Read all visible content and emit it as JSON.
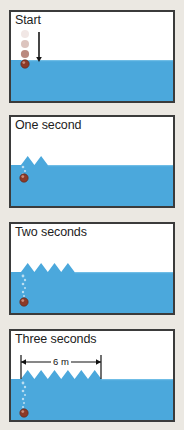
{
  "figure": {
    "title_alt": "Wave pulses generated by a falling ball",
    "background_color": "#ebe8e2",
    "water_color": "#4ba8dc",
    "water_color_light": "#6fbde6",
    "panel_border_color": "#3b3b3b",
    "panel_fill_color": "#ffffff",
    "ball_color": "#8c3a28",
    "bubble_color": "#cfe7f5"
  },
  "panels": [
    {
      "id": "start",
      "label": "Start",
      "time_seconds": 0,
      "wave_peaks": 0,
      "wavefront_x_m": 0,
      "water_level_y": 48,
      "ball": {
        "x": 14,
        "y": 52,
        "r": 4.2
      },
      "ball_trail": [
        {
          "x": 14,
          "y": 22,
          "r": 4.0,
          "opacity": 0.12
        },
        {
          "x": 14,
          "y": 32,
          "r": 4.0,
          "opacity": 0.3
        },
        {
          "x": 14,
          "y": 42,
          "r": 4.1,
          "opacity": 0.6
        }
      ],
      "arrow": {
        "x": 28,
        "y1": 20,
        "y2": 50
      },
      "bubbles": [],
      "dimension": null
    },
    {
      "id": "one-second",
      "label": "One second",
      "time_seconds": 1,
      "wave_peaks": 2,
      "wavefront_x_m": 2,
      "water_level_y": 48,
      "ball": {
        "x": 13,
        "y": 61,
        "r": 4.2
      },
      "ball_trail": [],
      "arrow": null,
      "bubbles": [
        {
          "x": 12,
          "y": 50,
          "r": 1.3
        },
        {
          "x": 14,
          "y": 54,
          "r": 1.1
        },
        {
          "x": 12,
          "y": 57,
          "r": 1.0
        }
      ],
      "dimension": null
    },
    {
      "id": "two-seconds",
      "label": "Two seconds",
      "time_seconds": 2,
      "wave_peaks": 4,
      "wavefront_x_m": 4,
      "water_level_y": 48,
      "ball": {
        "x": 13,
        "y": 78,
        "r": 4.2
      },
      "ball_trail": [],
      "arrow": null,
      "bubbles": [
        {
          "x": 12,
          "y": 52,
          "r": 1.4
        },
        {
          "x": 14,
          "y": 56,
          "r": 1.2
        },
        {
          "x": 12,
          "y": 60,
          "r": 1.3
        },
        {
          "x": 14,
          "y": 64,
          "r": 1.1
        },
        {
          "x": 12,
          "y": 68,
          "r": 1.2
        },
        {
          "x": 13,
          "y": 72,
          "r": 1.0
        }
      ],
      "dimension": null
    },
    {
      "id": "three-seconds",
      "label": "Three seconds",
      "time_seconds": 3,
      "wave_peaks": 6,
      "wavefront_x_m": 6,
      "water_level_y": 48,
      "ball": {
        "x": 13,
        "y": 82,
        "r": 4.2
      },
      "ball_trail": [],
      "arrow": null,
      "bubbles": [
        {
          "x": 12,
          "y": 52,
          "r": 1.4
        },
        {
          "x": 14,
          "y": 56,
          "r": 1.2
        },
        {
          "x": 12,
          "y": 60,
          "r": 1.3
        },
        {
          "x": 14,
          "y": 64,
          "r": 1.1
        },
        {
          "x": 12,
          "y": 68,
          "r": 1.2
        },
        {
          "x": 13,
          "y": 72,
          "r": 1.0
        },
        {
          "x": 12,
          "y": 76,
          "r": 1.1
        }
      ],
      "dimension": {
        "text": "6 m",
        "x_start": 10,
        "x_end": 90,
        "y": 31,
        "tick_top": 24,
        "tick_bottom": 48
      }
    }
  ],
  "geometry": {
    "wave_start_x": 10,
    "wavelength_px": 13.4,
    "wave_amplitude_px": 9,
    "panel_inner_width": 162,
    "panel_inner_height": 89
  },
  "chart_data": {
    "type": "diagram-series",
    "x": [
      0,
      1,
      2,
      3
    ],
    "xlabel": "Time (s)",
    "ylabel": "Distance travelled by wavefront (m)",
    "series": [
      {
        "name": "Wavefront distance (m)",
        "values": [
          0,
          2,
          4,
          6
        ]
      },
      {
        "name": "Number of wave crests",
        "values": [
          0,
          2,
          4,
          6
        ]
      }
    ],
    "annotations": [
      "Start",
      "One second",
      "Two seconds",
      "Three seconds",
      "6 m"
    ],
    "wave_speed_m_per_s": 2,
    "wavelength_m": 1
  }
}
